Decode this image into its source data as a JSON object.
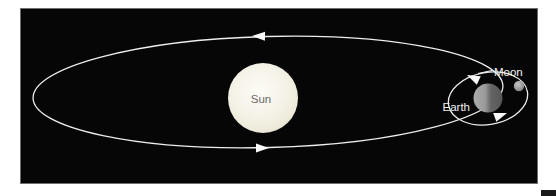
{
  "figure": {
    "type": "sun-earth-moon-orbit-diagram",
    "labels": {
      "sun": "Sun",
      "earth": "Earth",
      "moon": "Moon"
    },
    "colors": {
      "page_background": "#ffffff",
      "panel_background": "#060606",
      "orbit_line": "#ededed",
      "arrow_fill": "#fafafa",
      "sun_fill": "#f3f1e5",
      "earth_lit_side": "#a0a0a0",
      "earth_shadow_side": "#5c5c5c",
      "moon_fill": "#a9a9a9",
      "sun_label_text": "#6a6a6a",
      "planet_label_text": "#f2f2f2"
    }
  }
}
